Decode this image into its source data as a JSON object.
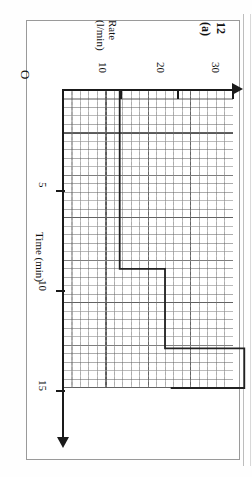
{
  "page": {
    "question_number": "12 (a)",
    "orientation": "rotated-90-clockwise",
    "origin_label": "O"
  },
  "axes": {
    "rate": {
      "label_line1": "Rate",
      "label_line2": "(l/min)",
      "unit": "l/min",
      "ticks": [
        "10",
        "20",
        "30"
      ],
      "tick_values": [
        10,
        20,
        30
      ],
      "min": 0,
      "max": 30,
      "minor_step": 2,
      "major_step": 10,
      "arrow": "right"
    },
    "time": {
      "label": "Time (min)",
      "unit": "min",
      "ticks": [
        "5",
        "10",
        "15"
      ],
      "tick_values": [
        5,
        10,
        15
      ],
      "min": 0,
      "max": 17,
      "minor_step": 1,
      "major_step": 5,
      "arrow": "down"
    }
  },
  "chart_data": {
    "type": "line",
    "title": "12 (a)",
    "xlabel": "Rate (l/min)",
    "ylabel": "Time (min)",
    "xlim": [
      0,
      30
    ],
    "ylim": [
      0,
      17
    ],
    "grid": true,
    "legend": null,
    "note": "Step (staircase) graph drawn on graph paper; axes rotated 90 degrees clockwise on the page. Rate on the horizontal axis, Time on the vertical axis increasing downwards.",
    "series": [
      {
        "name": "rate-vs-time step",
        "points": [
          {
            "rate": 10,
            "time": 0
          },
          {
            "rate": 10,
            "time": 9
          },
          {
            "rate": 18,
            "time": 9
          },
          {
            "rate": 18,
            "time": 13
          },
          {
            "rate": 32,
            "time": 13
          },
          {
            "rate": 32,
            "time": 15
          },
          {
            "rate": 19,
            "time": 15
          }
        ]
      }
    ]
  },
  "grid_paper": {
    "minor_cell_px": 8.5,
    "major_cell_minor_count": 5,
    "minor_line_color": "#5a5a5a",
    "major_line_color": "#282828"
  }
}
